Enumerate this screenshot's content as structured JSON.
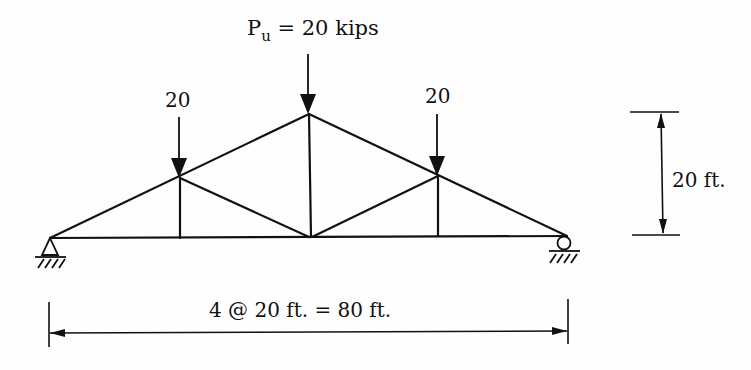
{
  "diagram": {
    "type": "roof truss (Howe-type) with loads",
    "loads": {
      "center": {
        "symbol": "P",
        "subscript": "u",
        "text": " = 20 kips",
        "value": 20,
        "unit": "kips"
      },
      "left": {
        "text": "20",
        "value": 20
      },
      "right": {
        "text": "20",
        "value": 20
      }
    },
    "dimensions": {
      "height": {
        "text": "20 ft.",
        "value": 20,
        "unit": "ft"
      },
      "span": {
        "text": "4 @ 20 ft. = 80 ft.",
        "panels": 4,
        "panel_length": 20,
        "total": 80,
        "unit": "ft"
      }
    },
    "supports": {
      "left": "pin",
      "right": "roller"
    },
    "colors": {
      "line": "#111111",
      "background": "#fefefe"
    }
  }
}
